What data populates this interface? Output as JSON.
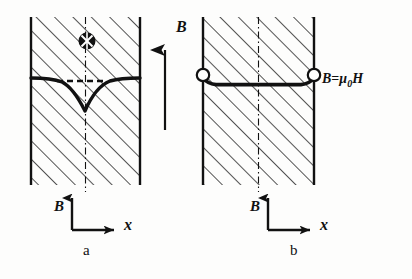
{
  "figure": {
    "kind": "physics-diagram",
    "ink_color": "#111111",
    "paper_color": "#fdfdfc",
    "hatch_color": "#1a1a1a"
  },
  "panels": [
    {
      "id": "panel-a",
      "caption": "a",
      "caption_pos": {
        "x": 84,
        "y": 252
      },
      "rect": {
        "x": 31,
        "y": 17,
        "width": 109,
        "height": 168
      },
      "centerline": {
        "x": 85.5,
        "dash": "7,3,1.5,3"
      },
      "symbol": {
        "name": "field-into-page-symbol",
        "glyph": "crossed-circle",
        "cx": 87,
        "cy": 41,
        "r": 8.5,
        "filled": true
      },
      "curve": {
        "name": "flux-profile-dip-curve",
        "flat_level_y": 78,
        "dip_apex": {
          "x": 85,
          "y": 111
        },
        "stroke_width": 3.4,
        "path": "M 31 78 C 44 78 54 79 62 82 C 70 86 78 97 85 111 C 91 97 100 85 110 81 C 120 78 131 78 140 78"
      },
      "dashed_segment": {
        "name": "flux-reference-dashed-line",
        "x1": 57,
        "x2": 103,
        "y": 81,
        "dash": "6,4",
        "stroke_width": 2.6
      },
      "axes": {
        "origin": {
          "x": 72,
          "y": 230
        },
        "b_label": {
          "text": "B",
          "x": 56,
          "y": 207
        },
        "x_label": {
          "text": "x",
          "x": 126,
          "y": 226
        },
        "b_arrow_len": 34,
        "x_arrow_len": 44
      }
    },
    {
      "id": "panel-b",
      "caption": "b",
      "caption_pos": {
        "x": 291,
        "y": 252
      },
      "rect": {
        "x": 203,
        "y": 17,
        "width": 111,
        "height": 168
      },
      "centerline": {
        "x": 258.5,
        "dash": "7,3,1.5,3"
      },
      "curve": {
        "name": "uniform-flux-line",
        "flat_level_y": 85,
        "stroke_width": 3.6,
        "path": "M 203 78 C 206 82 210 84 216 84.6 L 301 84.6 C 307 84 311 82 314 78"
      },
      "endpoint_markers": [
        {
          "name": "flux-endpoint-left",
          "cx": 203,
          "cy": 75,
          "r": 6.2,
          "filled": false
        },
        {
          "name": "flux-endpoint-right",
          "cx": 314,
          "cy": 75,
          "r": 6.2,
          "filled": false
        }
      ],
      "equation": {
        "name": "flux-equation-label",
        "b": "B",
        "equals": "=",
        "mu": "μ",
        "subscript": "0",
        "h": "H",
        "x": 325,
        "y": 80
      },
      "axes": {
        "origin": {
          "x": 268,
          "y": 230
        },
        "b_label": {
          "text": "B",
          "x": 252,
          "y": 207
        },
        "x_label": {
          "text": "x",
          "x": 322,
          "y": 226
        },
        "b_arrow_len": 34,
        "x_arrow_len": 44
      }
    }
  ],
  "center_arrow": {
    "name": "applied-field-arrow",
    "label": "B",
    "label_pos": {
      "x": 178,
      "y": 28
    },
    "x": 165,
    "y_tail": 130,
    "y_head": 48,
    "stroke_width": 2.2
  }
}
